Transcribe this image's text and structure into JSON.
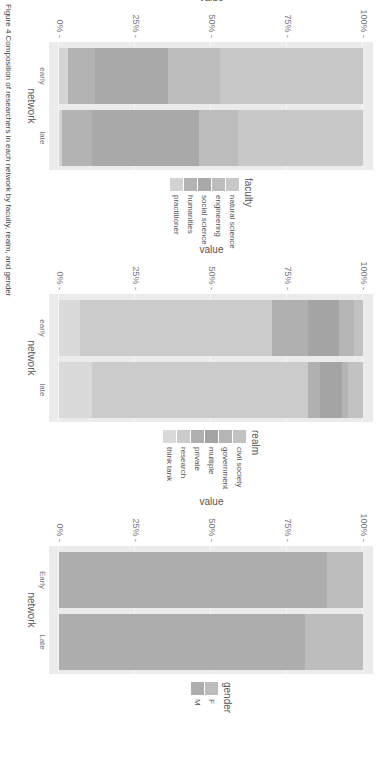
{
  "caption": "Figure 4 Composition of researchers in each network by faculty, realm, and gender",
  "chart_data": [
    {
      "type": "bar",
      "stacked": true,
      "percent": true,
      "title": "",
      "xlabel": "network",
      "ylabel": "value",
      "yticks": [
        "0%",
        "25%",
        "50%",
        "75%",
        "100%"
      ],
      "ylim": [
        0,
        100
      ],
      "categories": [
        "early",
        "late"
      ],
      "legend_title": "faculty",
      "series": [
        {
          "name": "natural science",
          "values": [
            47,
            41
          ],
          "color": "#c8c8c8"
        },
        {
          "name": "engineering",
          "values": [
            17,
            13
          ],
          "color": "#bdbdbd"
        },
        {
          "name": "social science",
          "values": [
            24,
            35
          ],
          "color": "#a9a9a9"
        },
        {
          "name": "humanities",
          "values": [
            9,
            10
          ],
          "color": "#b3b3b3"
        },
        {
          "name": "practitioner",
          "values": [
            3,
            1
          ],
          "color": "#d3d3d3"
        }
      ]
    },
    {
      "type": "bar",
      "stacked": true,
      "percent": true,
      "title": "",
      "xlabel": "network",
      "ylabel": "value",
      "yticks": [
        "0%",
        "25%",
        "50%",
        "75%",
        "100%"
      ],
      "ylim": [
        0,
        100
      ],
      "categories": [
        "early",
        "late"
      ],
      "legend_title": "realm",
      "series": [
        {
          "name": "civil society",
          "values": [
            3,
            5
          ],
          "color": "#c2c2c2"
        },
        {
          "name": "government",
          "values": [
            5,
            2
          ],
          "color": "#b5b5b5"
        },
        {
          "name": "multiple",
          "values": [
            10,
            7
          ],
          "color": "#a4a4a4"
        },
        {
          "name": "private",
          "values": [
            12,
            4
          ],
          "color": "#b0b0b0"
        },
        {
          "name": "research",
          "values": [
            63,
            71
          ],
          "color": "#cbcbcb"
        },
        {
          "name": "think tank",
          "values": [
            7,
            11
          ],
          "color": "#dadada"
        }
      ]
    },
    {
      "type": "bar",
      "stacked": true,
      "percent": true,
      "title": "",
      "xlabel": "network",
      "ylabel": "value",
      "yticks": [
        "0%",
        "25%",
        "50%",
        "75%",
        "100%"
      ],
      "ylim": [
        0,
        100
      ],
      "categories": [
        "Early",
        "Late"
      ],
      "legend_title": "gender",
      "series": [
        {
          "name": "F",
          "values": [
            12,
            19
          ],
          "color": "#bdbdbd"
        },
        {
          "name": "M",
          "values": [
            88,
            81
          ],
          "color": "#adadad"
        }
      ]
    }
  ]
}
